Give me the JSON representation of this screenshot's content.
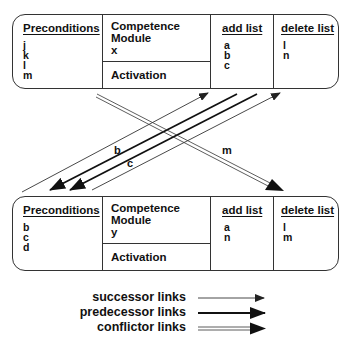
{
  "top_module": {
    "preconditions_header": "Preconditions",
    "preconditions": [
      "j",
      "k",
      "l",
      "m"
    ],
    "competence_module_label": "Competence Module",
    "module_name": "x",
    "activation_label": "Activation",
    "add_list_header": "add list",
    "add_list": [
      "a",
      "b",
      "c"
    ],
    "delete_list_header": "delete list",
    "delete_list": [
      "l",
      "n"
    ]
  },
  "bottom_module": {
    "preconditions_header": "Preconditions",
    "preconditions": [
      "b",
      "c",
      "d"
    ],
    "competence_module_label": "Competence Module",
    "module_name": "y",
    "activation_label": "Activation",
    "add_list_header": "add list",
    "add_list": [
      "a",
      "n"
    ],
    "delete_list_header": "delete list",
    "delete_list": [
      "l",
      "m"
    ]
  },
  "links": {
    "label_b": "b",
    "label_c": "c",
    "label_m": "m"
  },
  "legend": {
    "successor": "successor links",
    "predecessor": "predecessor links",
    "conflictor": "conflictor links"
  },
  "colors": {
    "line": "#222222",
    "background": "#ffffff"
  }
}
